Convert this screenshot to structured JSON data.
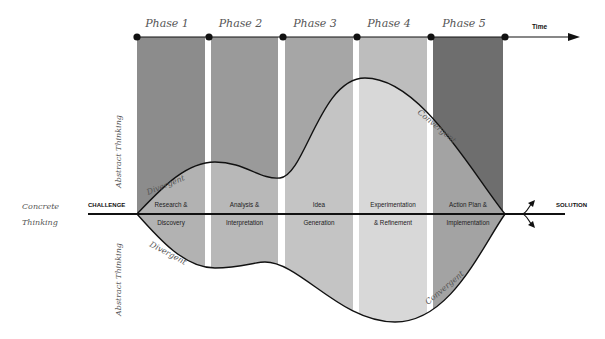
{
  "timeline": {
    "label": "Time",
    "phases": [
      {
        "label": "Phase 1",
        "activity_line1": "Research &",
        "activity_line2": "Discovery",
        "color_outer": "#8c8c8c",
        "color_inner": "#b2b2b2"
      },
      {
        "label": "Phase 2",
        "activity_line1": "Analysis &",
        "activity_line2": "Interpretation",
        "color_outer": "#9a9a9a",
        "color_inner": "#b8b8b8"
      },
      {
        "label": "Phase 3",
        "activity_line1": "Idea",
        "activity_line2": "Generation",
        "color_outer": "#a6a6a6",
        "color_inner": "#c4c4c4"
      },
      {
        "label": "Phase 4",
        "activity_line1": "Experimentation",
        "activity_line2": "& Refinement",
        "color_outer": "#bdbdbd",
        "color_inner": "#d8d8d8"
      },
      {
        "label": "Phase 5",
        "activity_line1": "Action Plan &",
        "activity_line2": "Implementation",
        "color_outer": "#6e6e6e",
        "color_inner": "#a3a3a3"
      }
    ]
  },
  "axis": {
    "start_label": "CHALLENGE",
    "end_label": "SOLUTION"
  },
  "side_labels": {
    "concrete_line1": "Concrete",
    "concrete_line2": "Thinking",
    "abstract_top": "Abstract Thinking",
    "abstract_bottom": "Abstract Thinking"
  },
  "curve_labels": {
    "divergent_top": "Divergent",
    "divergent_bottom": "Divergent",
    "convergent_top": "Convergent",
    "convergent_bottom": "Convergent"
  },
  "colors": {
    "line": "#111111",
    "script_text": "#555555"
  }
}
